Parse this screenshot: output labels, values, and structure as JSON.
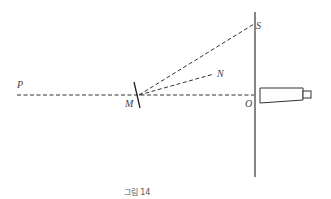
{
  "figure": {
    "caption": "그림 14",
    "colors": {
      "line": "#333333",
      "label": "#444444",
      "caption": "#555555"
    },
    "labels": {
      "P": "P",
      "M": "M",
      "N": "N",
      "S": "S",
      "O": "O"
    },
    "elements": [
      {
        "name": "scale-line",
        "type": "solid-vertical",
        "x": 255,
        "y1": 12,
        "y2": 177
      },
      {
        "name": "axis-PO",
        "type": "dashed",
        "from": [
          17,
          95
        ],
        "to": [
          255,
          95
        ]
      },
      {
        "name": "ray-MS",
        "type": "dashed",
        "from": [
          139,
          95
        ],
        "to": [
          255,
          24
        ]
      },
      {
        "name": "ray-MN",
        "type": "dashed",
        "from": [
          139,
          95
        ],
        "to": [
          214,
          74
        ]
      },
      {
        "name": "mirror",
        "type": "solid",
        "from": [
          134,
          82
        ],
        "to": [
          140,
          108
        ]
      },
      {
        "name": "telescope",
        "type": "tube",
        "body": [
          260,
          88,
          303,
          103
        ],
        "eyepiece": [
          303,
          91,
          311,
          98
        ]
      }
    ]
  }
}
